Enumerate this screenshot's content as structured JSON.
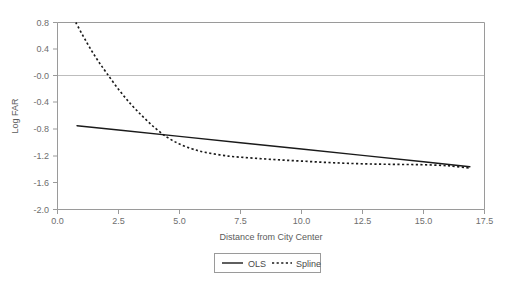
{
  "chart_data": {
    "type": "line",
    "title": "",
    "xlabel": "Distance from City Center",
    "ylabel": "Log FAR",
    "xlim": [
      0.0,
      17.5
    ],
    "ylim": [
      -2.0,
      0.8
    ],
    "grid": false,
    "reference_lines": [
      {
        "axis": "y",
        "value": 0.0,
        "color": "#bdbdbd"
      }
    ],
    "xticks": [
      "0.0",
      "2.5",
      "5.0",
      "7.5",
      "10.0",
      "12.5",
      "15.0",
      "17.5"
    ],
    "xtick_values": [
      0.0,
      2.5,
      5.0,
      7.5,
      10.0,
      12.5,
      15.0,
      17.5
    ],
    "yticks": [
      "0.8",
      "0.4",
      "-0.0",
      "-0.4",
      "-0.8",
      "-1.2",
      "-1.6",
      "-2.0"
    ],
    "ytick_values": [
      0.8,
      0.4,
      0.0,
      -0.4,
      -0.8,
      -1.2,
      -1.6,
      -2.0
    ],
    "legend": {
      "position": "bottom-center",
      "entries": [
        {
          "name": "OLS",
          "style": "solid",
          "color": "#1a1a1a"
        },
        {
          "name": "Spline",
          "style": "dashed",
          "color": "#1a1a1a"
        }
      ]
    },
    "series": [
      {
        "name": "OLS",
        "style": "solid",
        "color": "#1a1a1a",
        "x": [
          0.8,
          2.5,
          5.0,
          7.5,
          10.0,
          12.5,
          15.0,
          16.9
        ],
        "y": [
          -0.745,
          -0.81,
          -0.905,
          -1.0,
          -1.095,
          -1.19,
          -1.285,
          -1.36
        ]
      },
      {
        "name": "Spline",
        "style": "dashed",
        "color": "#1a1a1a",
        "x": [
          0.75,
          1.2,
          1.6,
          2.0,
          2.5,
          3.0,
          3.5,
          4.0,
          4.5,
          5.0,
          5.5,
          6.0,
          7.0,
          8.0,
          9.0,
          10.0,
          11.0,
          12.0,
          13.0,
          14.0,
          15.0,
          16.0,
          16.9
        ],
        "y": [
          0.8,
          0.5,
          0.26,
          0.05,
          -0.2,
          -0.42,
          -0.61,
          -0.78,
          -0.92,
          -1.02,
          -1.09,
          -1.14,
          -1.2,
          -1.23,
          -1.255,
          -1.275,
          -1.295,
          -1.31,
          -1.32,
          -1.325,
          -1.33,
          -1.345,
          -1.38
        ]
      }
    ]
  },
  "axes": {
    "xlabel": "Distance from City Center",
    "ylabel": "Log FAR"
  },
  "legend": {
    "ols_label": "OLS",
    "spline_label": "Spline"
  }
}
